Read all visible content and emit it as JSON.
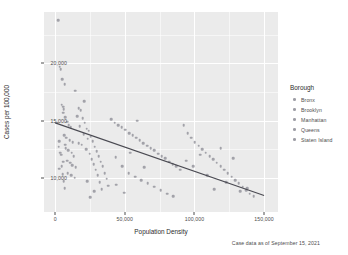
{
  "chart_data": {
    "type": "scatter",
    "title": "",
    "xlabel": "Population Density",
    "ylabel": "Cases per 100,000",
    "caption": "Case data as of September 15, 2021",
    "xlim": [
      -8000,
      160000
    ],
    "ylim": [
      7000,
      24500
    ],
    "grid": true,
    "legend_position": "right",
    "legend_title": "Borough",
    "x_ticks": [
      {
        "value": 0,
        "label": "0"
      },
      {
        "value": 50000,
        "label": "50,000"
      },
      {
        "value": 100000,
        "label": "100,000"
      },
      {
        "value": 150000,
        "label": "150,000"
      }
    ],
    "y_ticks": [
      {
        "value": 10000,
        "label": "10,000"
      },
      {
        "value": 15000,
        "label": "15,000"
      },
      {
        "value": 20000,
        "label": "20,000"
      }
    ],
    "series": [
      {
        "name": "Bronx",
        "color": "#8d8d96",
        "points": [
          [
            2100,
            23800
          ],
          [
            3400,
            19700
          ],
          [
            4100,
            19500
          ],
          [
            5200,
            18600
          ],
          [
            6900,
            18200
          ],
          [
            4800,
            16400
          ],
          [
            5600,
            16200
          ],
          [
            6100,
            16000
          ],
          [
            5900,
            15700
          ],
          [
            7300,
            15300
          ],
          [
            8800,
            14900
          ],
          [
            9600,
            14600
          ],
          [
            11200,
            14400
          ],
          [
            6400,
            13700
          ],
          [
            8100,
            13500
          ],
          [
            10400,
            13300
          ],
          [
            12600,
            13100
          ],
          [
            7700,
            12600
          ],
          [
            9300,
            12400
          ],
          [
            11800,
            12200
          ],
          [
            13400,
            11900
          ],
          [
            8500,
            11500
          ],
          [
            10900,
            11300
          ],
          [
            12100,
            11100
          ],
          [
            14800,
            10900
          ],
          [
            9100,
            10400
          ],
          [
            11600,
            10200
          ],
          [
            13900,
            10000
          ],
          [
            7100,
            12900
          ],
          [
            2700,
            12700
          ]
        ]
      },
      {
        "name": "Brooklyn",
        "color": "#8d8d96",
        "points": [
          [
            14200,
            17600
          ],
          [
            16900,
            16100
          ],
          [
            18400,
            15900
          ],
          [
            15700,
            15400
          ],
          [
            19800,
            15200
          ],
          [
            21300,
            14800
          ],
          [
            17500,
            14500
          ],
          [
            22700,
            14300
          ],
          [
            24100,
            14100
          ],
          [
            20500,
            13800
          ],
          [
            25600,
            13600
          ],
          [
            23400,
            13400
          ],
          [
            26900,
            13200
          ],
          [
            19100,
            12900
          ],
          [
            28300,
            12700
          ],
          [
            22100,
            12500
          ],
          [
            29700,
            12300
          ],
          [
            24800,
            12100
          ],
          [
            31200,
            11900
          ],
          [
            26300,
            11600
          ],
          [
            32600,
            11400
          ],
          [
            27700,
            11200
          ],
          [
            34100,
            11000
          ],
          [
            29100,
            10700
          ],
          [
            35500,
            10400
          ],
          [
            30600,
            10200
          ],
          [
            36900,
            9900
          ],
          [
            32100,
            9600
          ],
          [
            38300,
            9300
          ],
          [
            33500,
            9000
          ],
          [
            20900,
            16700
          ],
          [
            17000,
            13000
          ],
          [
            23000,
            9700
          ],
          [
            28000,
            8800
          ],
          [
            25000,
            8300
          ]
        ]
      },
      {
        "name": "Manhattan",
        "color": "#8d8d96",
        "points": [
          [
            40100,
            15100
          ],
          [
            42800,
            14800
          ],
          [
            45200,
            14600
          ],
          [
            47900,
            14400
          ],
          [
            50300,
            14200
          ],
          [
            53100,
            13900
          ],
          [
            55600,
            13700
          ],
          [
            58200,
            13500
          ],
          [
            60800,
            13300
          ],
          [
            63400,
            13000
          ],
          [
            66100,
            12800
          ],
          [
            68700,
            12600
          ],
          [
            71300,
            12400
          ],
          [
            74000,
            12100
          ],
          [
            76600,
            11900
          ],
          [
            79200,
            11700
          ],
          [
            81900,
            11400
          ],
          [
            84500,
            11200
          ],
          [
            87100,
            11000
          ],
          [
            89800,
            10700
          ],
          [
            43500,
            11800
          ],
          [
            48200,
            11000
          ],
          [
            52700,
            10400
          ],
          [
            57300,
            10100
          ],
          [
            61900,
            9800
          ],
          [
            66500,
            9500
          ],
          [
            71100,
            9200
          ],
          [
            75700,
            8900
          ],
          [
            80300,
            8600
          ],
          [
            84900,
            8400
          ],
          [
            44000,
            9400
          ],
          [
            49500,
            8700
          ],
          [
            54000,
            12200
          ],
          [
            59000,
            15000
          ],
          [
            64000,
            10900
          ]
        ]
      },
      {
        "name": "Queens",
        "color": "#8d8d96",
        "points": [
          [
            92400,
            14600
          ],
          [
            95100,
            13900
          ],
          [
            97700,
            13500
          ],
          [
            100300,
            13100
          ],
          [
            103000,
            12800
          ],
          [
            105600,
            12500
          ],
          [
            108200,
            12200
          ],
          [
            110900,
            11900
          ],
          [
            113500,
            11600
          ],
          [
            116100,
            11300
          ],
          [
            118800,
            11000
          ],
          [
            121400,
            10700
          ],
          [
            124000,
            10400
          ],
          [
            126700,
            10100
          ],
          [
            129300,
            9800
          ],
          [
            131900,
            9500
          ],
          [
            134600,
            9200
          ],
          [
            137200,
            8900
          ],
          [
            139800,
            8600
          ],
          [
            142500,
            8400
          ],
          [
            94000,
            11500
          ],
          [
            99000,
            11000
          ],
          [
            104000,
            12000
          ],
          [
            109000,
            10200
          ],
          [
            114000,
            9000
          ],
          [
            119000,
            12600
          ],
          [
            123000,
            9600
          ],
          [
            128000,
            11700
          ],
          [
            133000,
            8800
          ],
          [
            138000,
            9100
          ]
        ]
      },
      {
        "name": "Staten Island",
        "color": "#8d8d96",
        "points": [
          [
            1600,
            14800
          ],
          [
            2900,
            13200
          ],
          [
            3800,
            12200
          ],
          [
            4600,
            11000
          ],
          [
            5400,
            10300
          ],
          [
            6200,
            9700
          ],
          [
            7000,
            9100
          ],
          [
            3100,
            10800
          ],
          [
            4300,
            12000
          ],
          [
            5800,
            11400
          ]
        ]
      }
    ],
    "trend_line": {
      "type": "linear",
      "color": "#4a4a52",
      "x_start": 0,
      "y_start": 14800,
      "x_end": 150000,
      "y_end": 8450
    }
  },
  "legend": {
    "title": "Borough",
    "items": [
      {
        "label": "Bronx"
      },
      {
        "label": "Brooklyn"
      },
      {
        "label": "Manhattan"
      },
      {
        "label": "Queens"
      },
      {
        "label": "Staten Island"
      }
    ]
  },
  "colors": {
    "panel_background": "#ebebeb",
    "grid": "#ffffff",
    "point": "#8d8d96",
    "trend": "#4a4a52",
    "text": "#4d4d4d",
    "title_text": "#2b2b2b"
  }
}
